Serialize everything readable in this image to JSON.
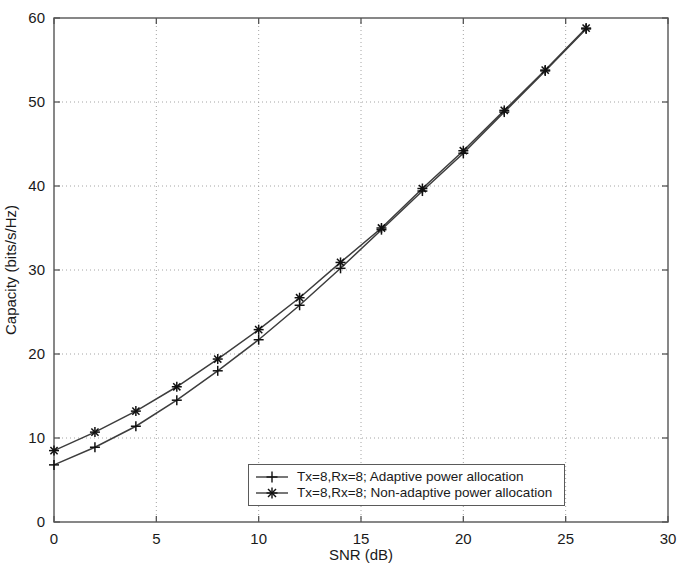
{
  "figure": {
    "background_color": "#ffffff",
    "line_color": "#3d3d3d",
    "axis_color": "#555555",
    "grid_color": "#9a9a9a"
  },
  "axes": {
    "x_title": "SNR (dB)",
    "y_title": "Capacity (bits/s/Hz)",
    "x_ticks": [
      "0",
      "5",
      "10",
      "15",
      "20",
      "25",
      "30"
    ],
    "y_ticks": [
      "0",
      "10",
      "20",
      "30",
      "40",
      "50",
      "60"
    ]
  },
  "legend": {
    "position": "bottom-center",
    "entries": [
      {
        "marker": "plus-marker",
        "label": "Tx=8,Rx=8; Adaptive power allocation"
      },
      {
        "marker": "star-marker",
        "label": "Tx=8,Rx=8; Non-adaptive power allocation"
      }
    ]
  },
  "chart_data": {
    "type": "line",
    "title": "",
    "xlabel": "SNR (dB)",
    "ylabel": "Capacity (bits/s/Hz)",
    "xlim": [
      0,
      30
    ],
    "ylim": [
      0,
      60
    ],
    "xticks": [
      0,
      5,
      10,
      15,
      20,
      25,
      30
    ],
    "yticks": [
      0,
      10,
      20,
      30,
      40,
      50,
      60
    ],
    "grid": true,
    "legend_position": "bottom-center",
    "x": [
      0,
      2,
      4,
      6,
      8,
      10,
      12,
      14,
      16,
      18,
      20,
      22,
      24,
      26
    ],
    "series": [
      {
        "name": "Tx=8,Rx=8; Adaptive power allocation",
        "marker": "plus-marker",
        "values": [
          6.8,
          8.9,
          11.4,
          14.5,
          18.0,
          21.7,
          25.8,
          30.2,
          34.8,
          39.4,
          43.9,
          48.8,
          53.7,
          58.7
        ]
      },
      {
        "name": "Tx=8,Rx=8; Non-adaptive power allocation",
        "marker": "star-marker",
        "values": [
          8.5,
          10.7,
          13.2,
          16.1,
          19.4,
          22.9,
          26.7,
          30.9,
          35.0,
          39.7,
          44.2,
          49.0,
          53.8,
          58.8
        ]
      }
    ]
  }
}
